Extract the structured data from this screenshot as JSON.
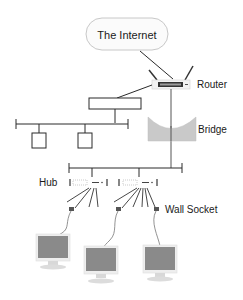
{
  "diagram": {
    "nodes": {
      "internet": {
        "label": "The Internet"
      },
      "router": {
        "label": "Router"
      },
      "bridge": {
        "label": "Bridge"
      },
      "hub": {
        "label": "Hub"
      },
      "wall_socket": {
        "label": "Wall Socket"
      }
    },
    "colors": {
      "line": "#2a2a2a",
      "cloud_fill": "#fbfbfb",
      "cloud_stroke": "#c8c8c8",
      "bridge_fill": "#c9c9c9",
      "monitor_screen": "#8a8a8a",
      "monitor_frame": "#eeeeee",
      "router_body": "#f2f2f2",
      "router_panel": "#333333"
    },
    "computers": 3,
    "hubs": 2,
    "lan_segment_nodes": 2
  }
}
